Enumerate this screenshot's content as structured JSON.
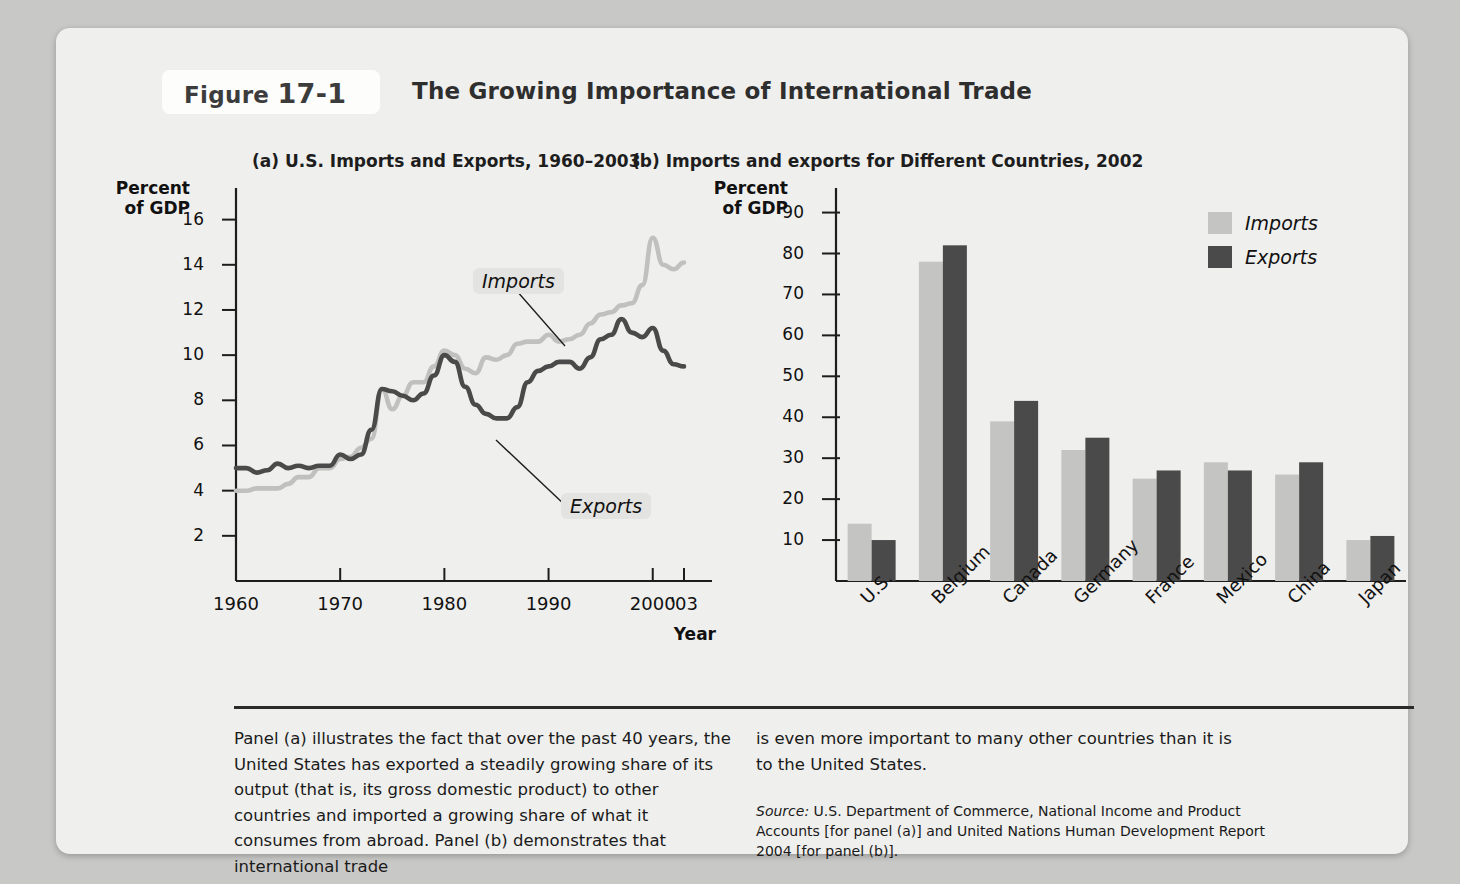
{
  "figure": {
    "tag_label": "Figure",
    "tag_number": "17-1",
    "title": "The Growing Importance of International Trade"
  },
  "panel_a": {
    "title": "(a) U.S. Imports and Exports, 1960–2003",
    "y_axis_title": "Percent\nof GDP",
    "x_axis_title": "Year",
    "callout_imports": "Imports",
    "callout_exports": "Exports"
  },
  "panel_b": {
    "title": "(b) Imports and exports for Different Countries, 2002",
    "y_axis_title": "Percent\nof GDP",
    "legend": [
      {
        "label": "Imports",
        "color": "#c4c4c2"
      },
      {
        "label": "Exports",
        "color": "#4a4a4a"
      }
    ]
  },
  "caption": {
    "left": "Panel (a) illustrates the fact that over the past 40 years, the United States has exported a steadily growing share of its output (that is, its gross domestic product) to other countries and imported a growing share of what it consumes from abroad. Panel (b) demonstrates that international trade",
    "right": "is even more important to many other countries than it is to the United States.",
    "source_label": "Source:",
    "source_text": " U.S. Department of Commerce, National Income and Product Accounts [for panel (a)] and United Nations Human Development Report 2004 [for panel (b)]."
  },
  "chart_data": [
    {
      "type": "line",
      "title": "(a) U.S. Imports and Exports, 1960–2003",
      "xlabel": "Year",
      "ylabel": "Percent of GDP",
      "xlim": [
        1960,
        2003
      ],
      "ylim": [
        0,
        17
      ],
      "yticks": [
        2,
        4,
        6,
        8,
        10,
        12,
        14,
        16
      ],
      "xticks": [
        1960,
        1970,
        1980,
        1990,
        2000,
        2003
      ],
      "xticklabels": [
        "1960",
        "1970",
        "1980",
        "1990",
        "2000",
        "'03"
      ],
      "grid": false,
      "legend_position": "inline-callouts",
      "x": [
        1960,
        1961,
        1962,
        1963,
        1964,
        1965,
        1966,
        1967,
        1968,
        1969,
        1970,
        1971,
        1972,
        1973,
        1974,
        1975,
        1976,
        1977,
        1978,
        1979,
        1980,
        1981,
        1982,
        1983,
        1984,
        1985,
        1986,
        1987,
        1988,
        1989,
        1990,
        1991,
        1992,
        1993,
        1994,
        1995,
        1996,
        1997,
        1998,
        1999,
        2000,
        2001,
        2002,
        2003
      ],
      "series": [
        {
          "name": "Imports",
          "color": "#c0c0be",
          "values": [
            4.0,
            4.0,
            4.1,
            4.1,
            4.1,
            4.3,
            4.6,
            4.6,
            5.0,
            5.0,
            5.4,
            5.5,
            5.9,
            6.3,
            8.5,
            7.6,
            8.2,
            8.8,
            8.8,
            9.5,
            10.2,
            10.0,
            9.4,
            9.2,
            9.9,
            9.8,
            10.0,
            10.5,
            10.6,
            10.6,
            10.9,
            10.6,
            10.7,
            10.9,
            11.4,
            11.8,
            11.9,
            12.2,
            12.3,
            13.1,
            15.2,
            14.0,
            13.8,
            14.1
          ]
        },
        {
          "name": "Exports",
          "color": "#4a4a4a",
          "values": [
            5.0,
            5.0,
            4.8,
            4.9,
            5.2,
            5.0,
            5.1,
            5.0,
            5.1,
            5.1,
            5.6,
            5.4,
            5.6,
            6.7,
            8.5,
            8.4,
            8.2,
            8.0,
            8.3,
            9.1,
            10.0,
            9.7,
            8.6,
            7.8,
            7.4,
            7.2,
            7.2,
            7.7,
            8.8,
            9.3,
            9.5,
            9.7,
            9.7,
            9.4,
            9.9,
            10.7,
            10.9,
            11.6,
            11.0,
            10.8,
            11.2,
            10.2,
            9.6,
            9.5
          ]
        }
      ]
    },
    {
      "type": "bar",
      "title": "(b) Imports and exports for Different Countries, 2002",
      "xlabel": "",
      "ylabel": "Percent of GDP",
      "ylim": [
        0,
        95
      ],
      "yticks": [
        10,
        20,
        30,
        40,
        50,
        60,
        70,
        80,
        90
      ],
      "grid": false,
      "legend_position": "top-right",
      "categories": [
        "U.S.",
        "Belgium",
        "Canada",
        "Germany",
        "France",
        "Mexico",
        "China",
        "Japan"
      ],
      "series": [
        {
          "name": "Imports",
          "color": "#c4c4c2",
          "values": [
            14,
            78,
            39,
            32,
            25,
            29,
            26,
            10
          ]
        },
        {
          "name": "Exports",
          "color": "#4a4a4a",
          "values": [
            10,
            82,
            44,
            35,
            27,
            27,
            29,
            11
          ]
        }
      ]
    }
  ]
}
